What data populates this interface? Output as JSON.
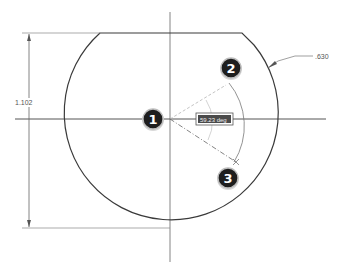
{
  "diagram": {
    "type": "cad-sketch-angle-dimension",
    "colors": {
      "background": "#ffffff",
      "geometry": "#3a3a3a",
      "centerline": "#555555",
      "construction": "#b8b8b8",
      "dimension": "#666666",
      "callout_fill": "#1e1e1e",
      "callout_ring": "#bdbdbd",
      "angle_label_bg": "#4a4a4a"
    },
    "dimensions": {
      "height_label": "1.102",
      "radius_label": ".630",
      "angle_label": "59.23 deg"
    },
    "callouts": [
      {
        "id": 1,
        "label": "1",
        "description": "arc center / vertex"
      },
      {
        "id": 2,
        "label": "2",
        "description": "first angle reference line"
      },
      {
        "id": 3,
        "label": "3",
        "description": "second angle reference line endpoint"
      }
    ]
  }
}
